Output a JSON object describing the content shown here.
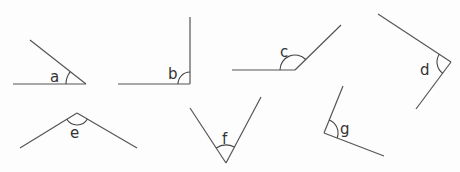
{
  "worksheet": {
    "heading_clipped": "",
    "angles": [
      {
        "label": "a",
        "type": "acute"
      },
      {
        "label": "b",
        "type": "right"
      },
      {
        "label": "c",
        "type": "obtuse"
      },
      {
        "label": "d",
        "type": "right"
      },
      {
        "label": "e",
        "type": "obtuse"
      },
      {
        "label": "f",
        "type": "acute"
      },
      {
        "label": "g",
        "type": "right"
      }
    ]
  },
  "colors": {
    "line": "#555555",
    "text": "#333333",
    "background": "#fdfdfd"
  }
}
